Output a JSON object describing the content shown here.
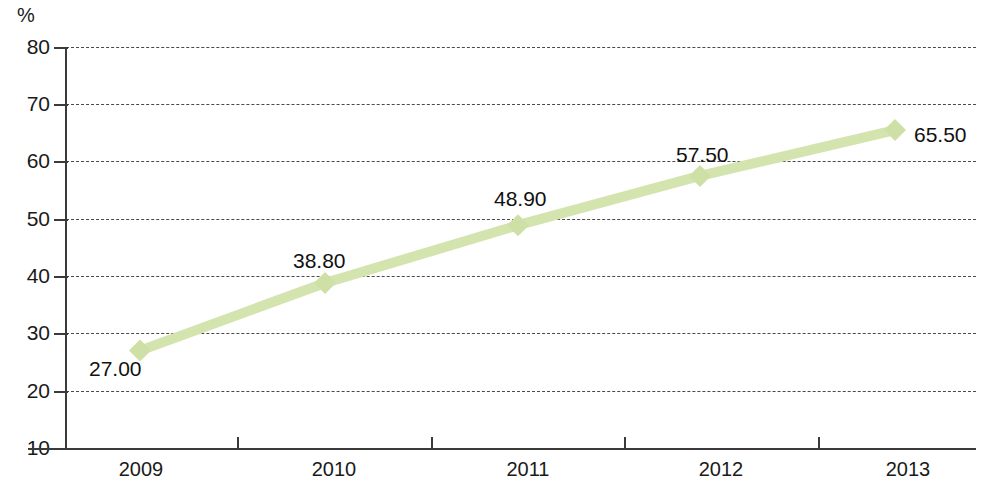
{
  "chart_data": {
    "type": "line",
    "title": "",
    "subtitle": "",
    "xlabel": "",
    "ylabel": "%",
    "unit_label": "%",
    "categories": [
      "2009",
      "2010",
      "2011",
      "2012",
      "2013"
    ],
    "values": [
      27.0,
      38.8,
      48.9,
      57.5,
      65.5
    ],
    "point_labels": [
      "27.00",
      "38.80",
      "48.90",
      "57.50",
      "65.50"
    ],
    "series": [
      {
        "name": "",
        "values": [
          27.0,
          38.8,
          48.9,
          57.5,
          65.5
        ]
      }
    ],
    "ylim": [
      10,
      80
    ],
    "ytick_labels": [
      "80",
      "70",
      "60",
      "50",
      "40",
      "30",
      "20",
      "10"
    ],
    "ytick_values": [
      80,
      70,
      60,
      50,
      40,
      30,
      20,
      10
    ],
    "grid": true,
    "grid_style": "dashed",
    "legend": false,
    "legend_position": "none",
    "marker": "diamond",
    "colors": {
      "series_line": "#d4e4ae",
      "marker": "#cfe0a6",
      "grid": "#4a4a4a",
      "axis": "#3a3a3a",
      "text": "#1a1a1a",
      "background": "#ffffff"
    }
  }
}
